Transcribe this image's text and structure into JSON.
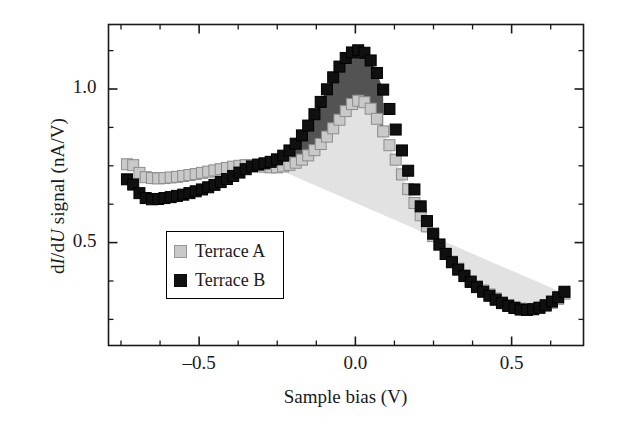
{
  "chart_data": {
    "type": "scatter",
    "title": "",
    "xlabel": "Sample bias (V)",
    "ylabel": "dI/dU signal (nA/V)",
    "ylabel_parts": {
      "pre": "d",
      "i1": "I",
      "mid": "/d",
      "i2": "U",
      "post": " signal (nA/V)"
    },
    "xlim": [
      -0.79,
      0.73
    ],
    "ylim": [
      0.165,
      1.21
    ],
    "xticks_major": [
      -0.5,
      0.0,
      0.5
    ],
    "xticks_major_labels": [
      "–0.5",
      "0.0",
      "0.5"
    ],
    "xticks_minor": [
      -0.75,
      -0.625,
      -0.375,
      -0.25,
      -0.125,
      0.125,
      0.25,
      0.375,
      0.625
    ],
    "yticks_major": [
      0.5,
      1.0
    ],
    "yticks_major_labels": [
      "0.5",
      "1.0"
    ],
    "yticks_minor": [
      0.25,
      0.375,
      0.625,
      0.75,
      0.875,
      1.125
    ],
    "grid": false,
    "legend_position": "center-left",
    "marker": "square",
    "marker_size_px": 11,
    "colors": {
      "terrace_a": "#c9c9c9",
      "terrace_a_edge": "#8c8c8c",
      "terrace_a_fill": "#e2e2e2",
      "terrace_b": "#101010",
      "terrace_b_edge": "#000000",
      "overlap_fill": "#4a4a4a",
      "axis": "#1a1a1a",
      "background": "#ffffff"
    },
    "series": [
      {
        "name": "Terrace A",
        "color": "#c9c9c9",
        "x": [
          -0.731,
          -0.711,
          -0.691,
          -0.671,
          -0.651,
          -0.631,
          -0.611,
          -0.591,
          -0.571,
          -0.551,
          -0.531,
          -0.511,
          -0.491,
          -0.471,
          -0.451,
          -0.431,
          -0.411,
          -0.391,
          -0.371,
          -0.351,
          -0.331,
          -0.311,
          -0.291,
          -0.271,
          -0.251,
          -0.231,
          -0.211,
          -0.191,
          -0.171,
          -0.151,
          -0.131,
          -0.111,
          -0.091,
          -0.071,
          -0.051,
          -0.031,
          -0.011,
          0.009,
          0.029,
          0.049,
          0.069,
          0.089,
          0.109,
          0.129,
          0.149,
          0.169,
          0.189,
          0.209,
          0.229,
          0.249,
          0.269,
          0.289,
          0.309,
          0.329,
          0.349,
          0.369,
          0.389,
          0.409,
          0.429,
          0.449,
          0.469,
          0.489,
          0.509,
          0.529,
          0.549,
          0.569,
          0.589,
          0.609,
          0.629,
          0.649,
          0.669
        ],
        "y": [
          0.755,
          0.752,
          0.727,
          0.713,
          0.71,
          0.709,
          0.71,
          0.712,
          0.714,
          0.717,
          0.72,
          0.723,
          0.727,
          0.731,
          0.735,
          0.739,
          0.743,
          0.747,
          0.75,
          0.752,
          0.752,
          0.75,
          0.747,
          0.745,
          0.745,
          0.748,
          0.753,
          0.76,
          0.77,
          0.784,
          0.801,
          0.821,
          0.845,
          0.872,
          0.9,
          0.928,
          0.951,
          0.962,
          0.957,
          0.936,
          0.903,
          0.862,
          0.817,
          0.77,
          0.722,
          0.674,
          0.629,
          0.589,
          0.553,
          0.521,
          0.492,
          0.464,
          0.438,
          0.415,
          0.394,
          0.375,
          0.358,
          0.344,
          0.331,
          0.318,
          0.306,
          0.297,
          0.29,
          0.285,
          0.283,
          0.284,
          0.288,
          0.294,
          0.304,
          0.317,
          0.334
        ]
      },
      {
        "name": "Terrace B",
        "color": "#101010",
        "x": [
          -0.731,
          -0.711,
          -0.691,
          -0.671,
          -0.651,
          -0.631,
          -0.611,
          -0.591,
          -0.571,
          -0.551,
          -0.531,
          -0.511,
          -0.491,
          -0.471,
          -0.451,
          -0.431,
          -0.411,
          -0.391,
          -0.371,
          -0.351,
          -0.331,
          -0.311,
          -0.291,
          -0.271,
          -0.251,
          -0.231,
          -0.211,
          -0.191,
          -0.171,
          -0.151,
          -0.131,
          -0.111,
          -0.091,
          -0.071,
          -0.051,
          -0.031,
          -0.011,
          0.009,
          0.029,
          0.049,
          0.069,
          0.089,
          0.109,
          0.129,
          0.149,
          0.169,
          0.189,
          0.209,
          0.229,
          0.249,
          0.269,
          0.289,
          0.309,
          0.329,
          0.349,
          0.369,
          0.389,
          0.409,
          0.429,
          0.449,
          0.469,
          0.489,
          0.509,
          0.529,
          0.549,
          0.569,
          0.589,
          0.609,
          0.629,
          0.649,
          0.669
        ],
        "y": [
          0.706,
          0.689,
          0.661,
          0.645,
          0.641,
          0.642,
          0.645,
          0.648,
          0.652,
          0.656,
          0.661,
          0.667,
          0.673,
          0.68,
          0.688,
          0.697,
          0.707,
          0.717,
          0.728,
          0.739,
          0.748,
          0.754,
          0.758,
          0.763,
          0.771,
          0.783,
          0.8,
          0.822,
          0.849,
          0.881,
          0.918,
          0.958,
          0.999,
          1.038,
          1.073,
          1.101,
          1.119,
          1.126,
          1.118,
          1.093,
          1.052,
          0.998,
          0.935,
          0.868,
          0.8,
          0.734,
          0.673,
          0.618,
          0.57,
          0.529,
          0.494,
          0.463,
          0.436,
          0.412,
          0.391,
          0.372,
          0.355,
          0.34,
          0.327,
          0.314,
          0.303,
          0.294,
          0.287,
          0.282,
          0.281,
          0.283,
          0.288,
          0.296,
          0.308,
          0.322,
          0.34
        ]
      }
    ],
    "annotations": {
      "peak_a_value": 0.96,
      "peak_a_bias": -0.01,
      "peak_b_value": 1.13,
      "peak_b_bias": 0.01,
      "min_right_value": 0.28,
      "min_right_bias": 0.5
    }
  },
  "legend": {
    "items": [
      {
        "label": "Terrace A",
        "swatch": "#c9c9c9"
      },
      {
        "label": "Terrace B",
        "swatch": "#101010"
      }
    ]
  }
}
